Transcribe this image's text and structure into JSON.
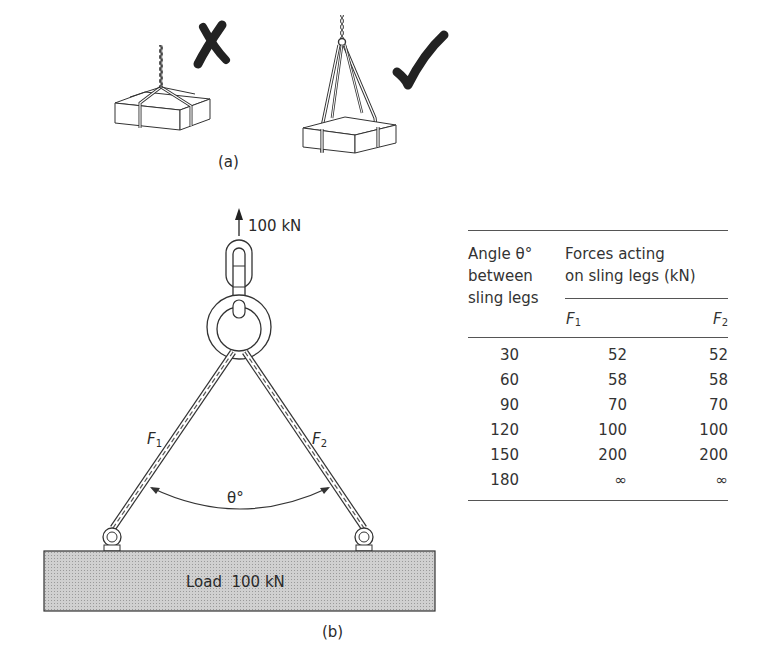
{
  "figure_a": {
    "caption": "(a)",
    "wrong_mark": "✗",
    "right_mark": "✓",
    "wrong_label": "incorrect-single-point-sling",
    "right_label": "correct-two-leg-sling"
  },
  "figure_b": {
    "caption": "(b)",
    "lift_force": "100 kN",
    "leg_left_label": "F",
    "leg_left_sub": "1",
    "leg_right_label": "F",
    "leg_right_sub": "2",
    "angle_label": "θ°",
    "load_label": "Load  100 kN",
    "load_fill": "#c8c8c8"
  },
  "table": {
    "col1_header": [
      "Angle θ°",
      "between",
      "sling legs"
    ],
    "group_header": [
      "Forces acting",
      "on sling legs (kN)"
    ],
    "sub_headers": [
      {
        "label": "F",
        "sub": "1"
      },
      {
        "label": "F",
        "sub": "2"
      }
    ],
    "rows": [
      {
        "angle": "30",
        "f1": "52",
        "f2": "52"
      },
      {
        "angle": "60",
        "f1": "58",
        "f2": "58"
      },
      {
        "angle": "90",
        "f1": "70",
        "f2": "70"
      },
      {
        "angle": "120",
        "f1": "100",
        "f2": "100"
      },
      {
        "angle": "150",
        "f1": "200",
        "f2": "200"
      },
      {
        "angle": "180",
        "f1": "∞",
        "f2": "∞"
      }
    ]
  }
}
